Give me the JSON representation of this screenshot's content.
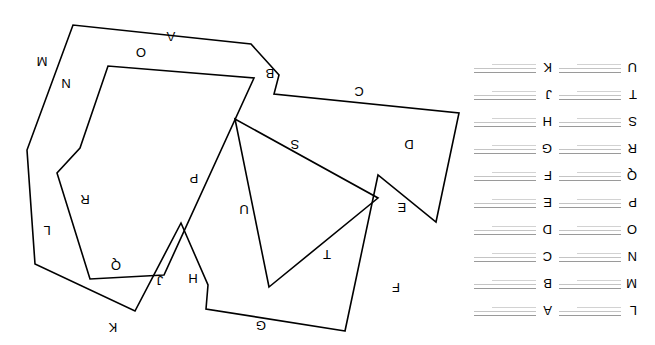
{
  "figure": {
    "rotation_degrees": 180,
    "background_color": "#ffffff",
    "stroke_color": "#000000",
    "legend_line_color": "#b9b9b9"
  },
  "legend": {
    "columns": [
      {
        "name": "legend-column-right",
        "entries": [
          {
            "letter": "A"
          },
          {
            "letter": "B"
          },
          {
            "letter": "C"
          },
          {
            "letter": "D"
          },
          {
            "letter": "E"
          },
          {
            "letter": "F"
          },
          {
            "letter": "G"
          },
          {
            "letter": "H"
          },
          {
            "letter": "J"
          },
          {
            "letter": "K"
          }
        ]
      },
      {
        "name": "legend-column-left",
        "entries": [
          {
            "letter": "L"
          },
          {
            "letter": "M"
          },
          {
            "letter": "N"
          },
          {
            "letter": "O"
          },
          {
            "letter": "P"
          },
          {
            "letter": "Q"
          },
          {
            "letter": "R"
          },
          {
            "letter": "S"
          },
          {
            "letter": "T"
          },
          {
            "letter": "U"
          }
        ]
      }
    ]
  },
  "shapes": {
    "outer_polygon": {
      "name": "outer-polygon",
      "points": "310,14 196,232 381,251 376,270 404,301 582,320 628,195 598,172 620,81 520,34 474,122 447,60 449,36 219,123 277,170",
      "path": "M 310,14 L 449,36 L 447,60 L 474,122 L 520,34 L 620,81 L 628,195 L 582,320 L 404,301 L 376,270 L 381,251 L 196,232 L 219,123 L 277,170 Z"
    },
    "inner_polygon": {
      "name": "inner-polygon",
      "points": "491,70 565,66 598,172 575,197 547,279 401,267",
      "path": "M 491,70 L 565,66 L 598,172 L 575,197 L 547,279 L 401,267 Z"
    },
    "triangle": {
      "name": "triangle",
      "path": "M 386,58 L 277,147 L 420,226 Z"
    }
  },
  "edge_labels": [
    {
      "letter": "A",
      "x": 484,
      "y": 313,
      "shape": "outer-polygon"
    },
    {
      "letter": "B",
      "x": 385,
      "y": 276,
      "shape": "outer-polygon"
    },
    {
      "letter": "C",
      "x": 296,
      "y": 258,
      "shape": "outer-polygon"
    },
    {
      "letter": "D",
      "x": 246,
      "y": 205,
      "shape": "outer-polygon"
    },
    {
      "letter": "E",
      "x": 253,
      "y": 142,
      "shape": "outer-polygon"
    },
    {
      "letter": "F",
      "x": 259,
      "y": 62,
      "shape": "outer-polygon"
    },
    {
      "letter": "G",
      "x": 394,
      "y": 24,
      "shape": "outer-polygon"
    },
    {
      "letter": "H",
      "x": 462,
      "y": 71,
      "shape": "outer-polygon"
    },
    {
      "letter": "J",
      "x": 495,
      "y": 69,
      "shape": "outer-polygon"
    },
    {
      "letter": "K",
      "x": 542,
      "y": 22,
      "shape": "outer-polygon"
    },
    {
      "letter": "L",
      "x": 608,
      "y": 119,
      "shape": "outer-polygon"
    },
    {
      "letter": "M",
      "x": 613,
      "y": 288,
      "shape": "outer-polygon"
    },
    {
      "letter": "N",
      "x": 589,
      "y": 266,
      "shape": "inner-polygon"
    },
    {
      "letter": "O",
      "x": 514,
      "y": 297,
      "shape": "inner-polygon"
    },
    {
      "letter": "P",
      "x": 461,
      "y": 171,
      "shape": "inner-polygon"
    },
    {
      "letter": "Q",
      "x": 539,
      "y": 84,
      "shape": "inner-polygon"
    },
    {
      "letter": "R",
      "x": 570,
      "y": 150,
      "shape": "inner-polygon"
    },
    {
      "letter": "S",
      "x": 360,
      "y": 205,
      "shape": "triangle"
    },
    {
      "letter": "T",
      "x": 328,
      "y": 95,
      "shape": "triangle"
    },
    {
      "letter": "U",
      "x": 411,
      "y": 140,
      "shape": "triangle"
    }
  ]
}
